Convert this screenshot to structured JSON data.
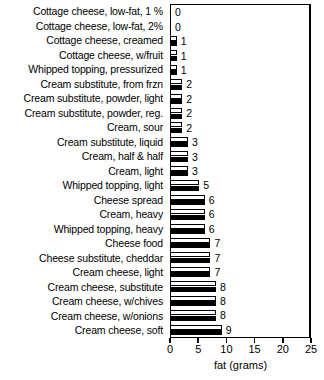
{
  "chart_data": {
    "type": "bar",
    "orientation": "horizontal",
    "title": "",
    "xlabel": "fat (grams)",
    "ylabel": "",
    "xlim": [
      0,
      25
    ],
    "xticks": [
      0,
      5,
      10,
      15,
      20,
      25
    ],
    "xtick_labels": [
      "0",
      "5",
      "10",
      "15",
      "20",
      "25"
    ],
    "grid": false,
    "legend": null,
    "bar_style": "paired white-outline over solid black",
    "categories": [
      "Cottage cheese, low-fat, 1 %",
      "Cottage cheese, low-fat, 2%",
      "Cottage cheese, creamed",
      "Cottage cheese, w/fruit",
      "Whipped topping, pressurized",
      "Cream substitute, from frzn",
      "Cream substitute, powder, light",
      "Cream substitute, powder, reg.",
      "Cream, sour",
      "Cream substitute, liquid",
      "Cream, half & half",
      "Cream, light",
      "Whipped topping, light",
      "Cheese spread",
      "Cream, heavy",
      "Whipped topping, heavy",
      "Cheese food",
      "Cheese substitute, cheddar",
      "Cream cheese, light",
      "Cream cheese, substitute",
      "Cream cheese, w/chives",
      "Cream cheese, w/onions",
      "Cream cheese, soft"
    ],
    "values": [
      0,
      0,
      1,
      1,
      1,
      2,
      2,
      2,
      2,
      3,
      3,
      3,
      5,
      6,
      6,
      6,
      7,
      7,
      7,
      8,
      8,
      8,
      9
    ],
    "value_labels": [
      "0",
      "0",
      "1",
      "1",
      "1",
      "2",
      "2",
      "2",
      "2",
      "3",
      "3",
      "3",
      "5",
      "6",
      "6",
      "6",
      "7",
      "7",
      "7",
      "8",
      "8",
      "8",
      "9"
    ]
  },
  "colors": {
    "bar_fill_white": "#ffffff",
    "bar_fill_black": "#000000",
    "outline": "#000000",
    "background": "#ffffff",
    "text": "#000000"
  }
}
